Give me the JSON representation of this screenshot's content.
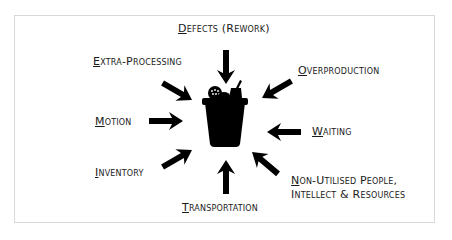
{
  "diagram": {
    "title": "",
    "center_icon": "trash-bin-icon",
    "colors": {
      "background": "#ffffff",
      "frame_border": "#d8d8d8",
      "ink": "#000000",
      "text": "#1a1a1a"
    },
    "wastes": [
      {
        "id": "defects",
        "first": "D",
        "rest": "efects (Rework)"
      },
      {
        "id": "overproduction",
        "first": "O",
        "rest": "verproduction"
      },
      {
        "id": "waiting",
        "first": "W",
        "rest": "aiting"
      },
      {
        "id": "non-utilised",
        "first": "N",
        "rest": "on-Utilised People,",
        "line2": "Intellect & Resources"
      },
      {
        "id": "transportation",
        "first": "T",
        "rest": "ransportation"
      },
      {
        "id": "inventory",
        "first": "I",
        "rest": "nventory"
      },
      {
        "id": "motion",
        "first": "M",
        "rest": "otion"
      },
      {
        "id": "extra-processing",
        "first": "E",
        "rest": "xtra-Processing"
      }
    ]
  }
}
